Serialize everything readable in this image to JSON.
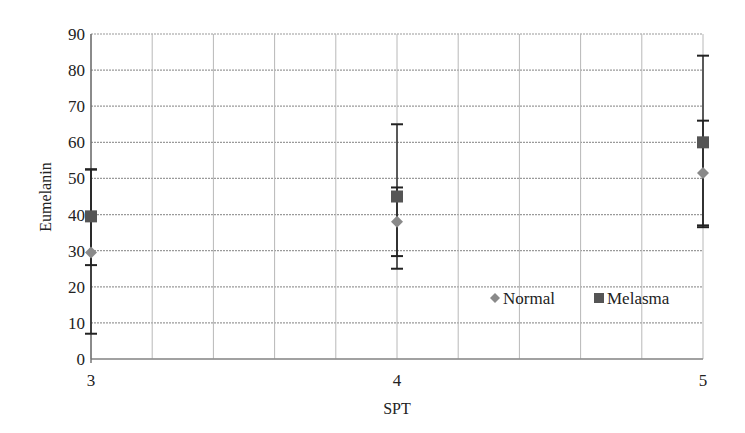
{
  "chart_data": {
    "type": "scatter",
    "title": "",
    "xlabel": "SPT",
    "ylabel": "Eumelanin",
    "xlim": [
      3,
      5
    ],
    "ylim": [
      0,
      90
    ],
    "x_ticks": [
      3,
      4,
      5
    ],
    "y_ticks": [
      0,
      10,
      20,
      30,
      40,
      50,
      60,
      70,
      80,
      90
    ],
    "x_minor_grid_step": 0.2,
    "grid": true,
    "legend_position": "lower-right inside",
    "x": [
      3,
      4,
      5
    ],
    "series": [
      {
        "name": "Normal",
        "marker": "diamond",
        "color": "#8a8a8a",
        "values": [
          29.5,
          38,
          51.5
        ],
        "error_low": [
          7,
          28.5,
          37
        ],
        "error_high": [
          52.5,
          47.5,
          66
        ]
      },
      {
        "name": "Melasma",
        "marker": "square",
        "color": "#555555",
        "values": [
          39.5,
          45,
          60
        ],
        "error_low": [
          26,
          25,
          36.5
        ],
        "error_high": [
          52.5,
          65,
          84
        ]
      }
    ]
  },
  "labels": {
    "xlabel": "SPT",
    "ylabel": "Eumelanin",
    "legend": [
      "Normal",
      "Melasma"
    ]
  }
}
